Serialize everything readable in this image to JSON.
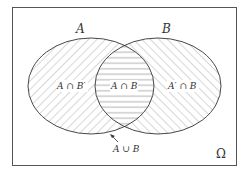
{
  "diagram": {
    "type": "venn",
    "universe_label": "Ω",
    "sets": [
      {
        "name": "A",
        "label": "A"
      },
      {
        "name": "B",
        "label": "B"
      }
    ],
    "regions": {
      "a_only": "A ∩ B′",
      "intersection": "A ∩ B",
      "b_only": "A′ ∩ B"
    },
    "union_label": "A ∪ B",
    "colors": {
      "stroke": "#333333",
      "hatch": "#9a9a9a",
      "background": "#ffffff"
    }
  }
}
